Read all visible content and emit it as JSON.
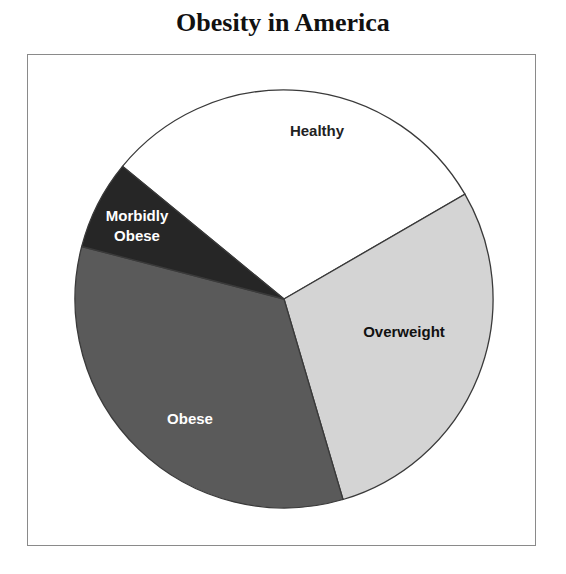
{
  "title": "Obesity in America",
  "chart_data": {
    "type": "pie",
    "title": "Obesity in America",
    "categories": [
      "Healthy",
      "Overweight",
      "Obese",
      "Morbidly Obese"
    ],
    "values": [
      30.7,
      28.8,
      33.6,
      6.9
    ],
    "unit": "percent (estimated from slice angles)",
    "colors": [
      "#ffffff",
      "#d4d4d4",
      "#5a5a5a",
      "#262626"
    ],
    "label_colors": [
      "#222222",
      "#111111",
      "#ffffff",
      "#ffffff"
    ],
    "start_angle_deg": -50.6,
    "legend": "none (labels drawn inside slices)",
    "labels": [
      {
        "text": "Healthy",
        "lines": [
          "Healthy"
        ]
      },
      {
        "text": "Overweight",
        "lines": [
          "Overweight"
        ]
      },
      {
        "text": "Obese",
        "lines": [
          "Obese"
        ]
      },
      {
        "text": "Morbidly Obese",
        "lines": [
          "Morbidly",
          "Obese"
        ]
      }
    ]
  }
}
